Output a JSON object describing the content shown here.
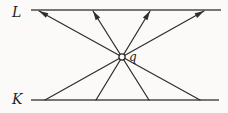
{
  "figure": {
    "type": "diagram",
    "background": "#fbfaf8",
    "colors": {
      "rail": "#4a4a48",
      "ray": "#2e2e2c",
      "label": "#1f1f1d"
    },
    "labels": {
      "top_line": "L",
      "bottom_line": "K",
      "point": "q"
    },
    "geometry": {
      "width": 228,
      "height": 113,
      "top_line": {
        "x1": 31,
        "y1": 10,
        "x2": 221,
        "y2": 10
      },
      "bottom_line": {
        "x1": 31,
        "y1": 100,
        "x2": 219,
        "y2": 100
      },
      "rays": [
        {
          "x1": 200,
          "y1": 100,
          "x2": 39,
          "y2": 11
        },
        {
          "x1": 149,
          "y1": 100,
          "x2": 93,
          "y2": 11
        },
        {
          "x1": 96,
          "y1": 100,
          "x2": 150,
          "y2": 11
        },
        {
          "x1": 45,
          "y1": 100,
          "x2": 204,
          "y2": 11
        }
      ],
      "point": {
        "cx": 122,
        "cy": 57,
        "r": 3.1
      },
      "label_anchors": {
        "top_line": {
          "x": 12,
          "y": 17
        },
        "bottom_line": {
          "x": 12,
          "y": 104
        },
        "point": {
          "x": 129,
          "y": 61
        }
      }
    }
  }
}
